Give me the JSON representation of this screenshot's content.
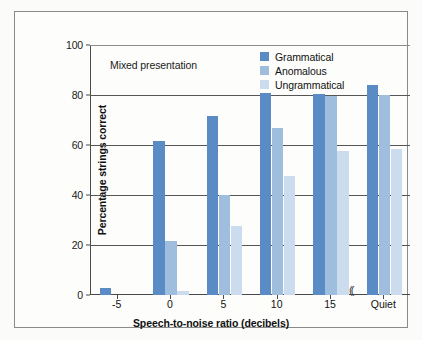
{
  "figure": {
    "background_color": "#fdfdfb",
    "border_color": "#8a8a8a"
  },
  "annotation": "Mixed presentation",
  "legend": {
    "position": "top-right-inside",
    "entries": [
      {
        "label": "Grammatical",
        "color": "#5b8bc4"
      },
      {
        "label": "Anomalous",
        "color": "#9fbedd"
      },
      {
        "label": "Ungrammatical",
        "color": "#cbdcee"
      }
    ]
  },
  "axes": {
    "y": {
      "label": "Percentage strings correct",
      "ticks": [
        "0",
        "20",
        "40",
        "60",
        "80",
        "100"
      ],
      "min": 0,
      "max": 100
    },
    "x": {
      "label": "Speech-to-noise ratio (decibels)",
      "ticks": [
        "-5",
        "0",
        "5",
        "10",
        "15",
        "Quiet"
      ],
      "break_marker": "((",
      "break_before": "Quiet"
    }
  },
  "chart_data": {
    "type": "bar",
    "title": "",
    "subtitle": "Mixed presentation",
    "xlabel": "Speech-to-noise ratio (decibels)",
    "ylabel": "Percentage strings correct",
    "ylim": [
      0,
      100
    ],
    "yticks": [
      0,
      20,
      40,
      60,
      80,
      100
    ],
    "grid": true,
    "grid_axis": "y",
    "legend_position": "upper right",
    "categories": [
      "-5",
      "0",
      "5",
      "10",
      "15",
      "Quiet"
    ],
    "series": [
      {
        "name": "Grammatical",
        "color": "#5b8bc4",
        "values": [
          3,
          61.5,
          71.5,
          81,
          80.5,
          84
        ]
      },
      {
        "name": "Anomalous",
        "color": "#9fbedd",
        "values": [
          0,
          21.5,
          40,
          67,
          79.5,
          80
        ]
      },
      {
        "name": "Ungrammatical",
        "color": "#cbdcee",
        "values": [
          0,
          1.5,
          27.5,
          47.5,
          57.5,
          58.5
        ]
      }
    ]
  }
}
